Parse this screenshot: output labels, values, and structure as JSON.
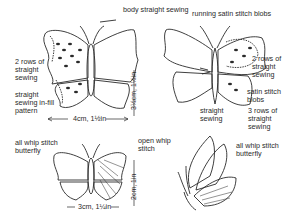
{
  "diagram": {
    "labels": {
      "body_straight_sewing": "body straight sewing",
      "running_satin_stitch_blobs": "running satin stitch blobs",
      "two_rows_straight_sewing_left": "2 rows of\nstraight\nsewing",
      "straight_infill_pattern": "straight\nsewing in-fill\npattern",
      "two_rows_straight_sewing_right": "2 rows of\nstraight\nsewing",
      "satin_stitch_blobs": "satin stitch\nblobs",
      "straight_sewing": "straight\nsewing",
      "three_rows_straight_sewing": "3 rows of\nstraight\nsewing",
      "all_whip_stitch_left": "all whip stitch\nbutterfly",
      "open_whip_stitch": "open whip\nstitch",
      "all_whip_stitch_right": "all whip stitch\nbutterfly"
    },
    "dimensions": {
      "large_width": "4cm, 1½in",
      "large_height": "3½cm, 1½in",
      "small_width": "3cm, 1¼in",
      "small_height": "2cm, 1in"
    }
  }
}
